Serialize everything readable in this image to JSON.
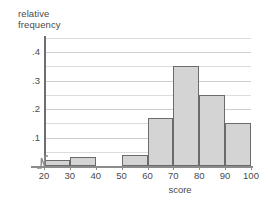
{
  "chart_data": {
    "type": "bar",
    "title": "",
    "subtitle": "",
    "xlabel": "score",
    "ylabel": "relative\nfrequency",
    "categories": [
      "20-30",
      "30-40",
      "40-50",
      "50-60",
      "60-70",
      "70-80",
      "80-90",
      "90-100"
    ],
    "bin_edges": [
      20,
      30,
      40,
      50,
      60,
      70,
      80,
      90,
      100
    ],
    "values": [
      0.02,
      0.03,
      0,
      0.04,
      0.17,
      0.35,
      0.25,
      0.15
    ],
    "xlim": [
      20,
      100
    ],
    "ylim": [
      0,
      0.45
    ],
    "x_tick_labels": [
      "20",
      "30",
      "40",
      "50",
      "60",
      "70",
      "80",
      "90",
      "100"
    ],
    "y_tick_labels": [
      ".1",
      ".2",
      ".3",
      ".4"
    ],
    "y_tick_values": [
      0.1,
      0.2,
      0.3,
      0.4
    ],
    "y_minor_tick_values": [
      0.05,
      0.15,
      0.25,
      0.35,
      0.45
    ],
    "grid": true,
    "legend": "none",
    "axis_break": "y-axis-zigzag",
    "colors": {
      "bar_fill": "#d4d4d4",
      "bar_stroke": "#6b6b6b",
      "grid": "#dcdcdc",
      "axis": "#8c8c8c",
      "text": "#4a4a4a"
    }
  }
}
